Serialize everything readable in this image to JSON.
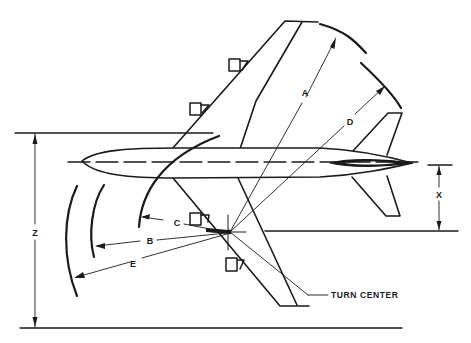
{
  "diagram": {
    "colors": {
      "ink": "#1a1a1a",
      "background": "#ffffff"
    },
    "labels": {
      "A": "A",
      "B": "B",
      "C": "C",
      "D": "D",
      "E": "E",
      "X": "X",
      "Z": "Z",
      "turn_center": "TURN CENTER"
    },
    "annotations": [
      {
        "id": "A",
        "description": "radius to outer wing tip"
      },
      {
        "id": "B",
        "description": "radius to nose gear path"
      },
      {
        "id": "C",
        "description": "radius to inner arc"
      },
      {
        "id": "D",
        "description": "radius to horizontal stabilizer tip"
      },
      {
        "id": "E",
        "description": "radius to nose"
      },
      {
        "id": "X",
        "description": "offset of turn center from centerline"
      },
      {
        "id": "Z",
        "description": "total turning width"
      }
    ]
  }
}
